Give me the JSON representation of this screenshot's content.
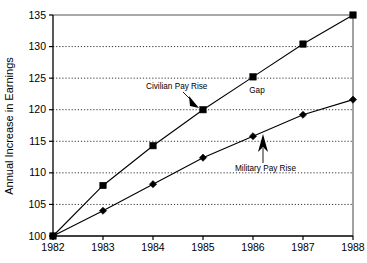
{
  "chart_data": {
    "type": "line",
    "title": "",
    "subtitle": "",
    "xlabel": "",
    "ylabel": "Annual Increase in Earnings",
    "categories": [
      "1982",
      "1983",
      "1984",
      "1985",
      "1986",
      "1987",
      "1988"
    ],
    "x": [
      1982,
      1983,
      1984,
      1985,
      1986,
      1987,
      1988
    ],
    "xlim": [
      1982,
      1988
    ],
    "ylim": [
      100,
      135
    ],
    "yticks": [
      100,
      105,
      110,
      115,
      120,
      125,
      130,
      135
    ],
    "ytick_labels": [
      "100",
      "105",
      "110",
      "115",
      "120",
      "125",
      "130",
      "135"
    ],
    "xticks": [
      1982,
      1983,
      1984,
      1985,
      1986,
      1987,
      1988
    ],
    "xtick_labels": [
      "1982",
      "1983",
      "1984",
      "1985",
      "1986",
      "1987",
      "1988"
    ],
    "grid": "horizontal-dotted",
    "legend": "none",
    "series": [
      {
        "name": "Civilian Pay Rise",
        "marker": "square",
        "values": [
          100,
          108,
          114.3,
          120,
          125.2,
          130.4,
          135
        ]
      },
      {
        "name": "Military Pay Rise",
        "marker": "diamond",
        "values": [
          100,
          104,
          108.2,
          112.4,
          115.8,
          119.2,
          121.6
        ]
      }
    ],
    "annotations": [
      {
        "text": "Civilian Pay Rise",
        "points_to_year": 1985,
        "points_to_value": 120
      },
      {
        "text": "Gap",
        "at_year": 1986.25,
        "at_value": 124.1
      },
      {
        "text": "Military Pay Rise",
        "points_to_year": 1986,
        "points_to_value": 115.8
      }
    ],
    "colors": {
      "line": "#000000",
      "marker": "#000000",
      "grid": "#000000",
      "background": "#ffffff",
      "frame": "#555555"
    }
  }
}
